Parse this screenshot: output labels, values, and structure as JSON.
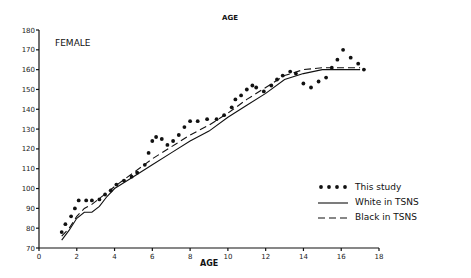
{
  "chart_data": {
    "type": "line",
    "title": "AGE",
    "panel_label": "FEMALE",
    "xlabel": "AGE",
    "ylabel": "",
    "xlim": [
      0,
      18
    ],
    "ylim": [
      70,
      180
    ],
    "x_ticks": [
      0,
      2,
      4,
      6,
      8,
      10,
      12,
      14,
      16,
      18
    ],
    "x_tick_labels": [
      "0",
      "2",
      "4",
      "6",
      "8",
      "10",
      "12",
      "14",
      "16",
      "18"
    ],
    "y_ticks": [
      70,
      80,
      90,
      100,
      110,
      120,
      130,
      140,
      150,
      160,
      170,
      180
    ],
    "y_tick_labels": [
      "70",
      "80",
      "90",
      "100",
      "110",
      "120",
      "130",
      "140",
      "150",
      "160",
      "170",
      "180"
    ],
    "grid": false,
    "legend_position": "lower right",
    "legend": [
      {
        "label": "This study",
        "style": "dots"
      },
      {
        "label": "White in TSNS",
        "style": "solid"
      },
      {
        "label": "Black in TSNS",
        "style": "dashed"
      }
    ],
    "series": [
      {
        "name": "This study",
        "style": "dots",
        "x": [
          1.2,
          1.4,
          1.7,
          1.9,
          2.1,
          2.5,
          2.8,
          3.2,
          3.5,
          3.8,
          4.1,
          4.5,
          4.9,
          5.2,
          5.6,
          5.8,
          6.0,
          6.2,
          6.5,
          6.8,
          7.1,
          7.4,
          7.7,
          8.0,
          8.4,
          8.9,
          9.4,
          9.8,
          10.2,
          10.4,
          10.7,
          11.0,
          11.3,
          11.5,
          11.9,
          12.3,
          12.6,
          12.9,
          13.3,
          13.6,
          14.0,
          14.4,
          14.8,
          15.2,
          15.5,
          15.8,
          16.1,
          16.5,
          16.9,
          17.2
        ],
        "y": [
          78,
          82,
          86,
          90,
          94,
          94,
          94,
          94.5,
          97,
          99,
          102,
          104,
          106,
          108,
          112,
          118,
          124,
          126,
          125,
          122,
          124,
          127,
          131,
          134,
          134,
          135,
          135,
          137,
          141,
          145,
          147,
          150,
          152,
          151,
          149,
          152,
          155,
          157,
          159,
          158,
          153,
          151,
          154,
          156,
          161,
          165,
          170,
          166,
          163,
          160
        ]
      },
      {
        "name": "White in TSNS",
        "style": "solid",
        "x": [
          1.2,
          1.6,
          2.0,
          2.4,
          2.8,
          3.2,
          3.6,
          4.0,
          5.0,
          6.0,
          7.0,
          8.0,
          9.0,
          10.0,
          11.0,
          12.0,
          13.0,
          14.0,
          15.0,
          16.0,
          17.0
        ],
        "y": [
          74,
          79,
          85,
          88,
          88,
          91,
          96,
          100,
          106,
          112,
          118,
          124,
          129,
          136,
          142,
          148,
          155,
          158,
          160,
          160,
          160
        ]
      },
      {
        "name": "Black in TSNS",
        "style": "dashed",
        "x": [
          1.2,
          1.6,
          2.0,
          2.4,
          2.8,
          3.2,
          3.6,
          4.0,
          5.0,
          6.0,
          7.0,
          8.0,
          9.0,
          10.0,
          11.0,
          12.0,
          13.0,
          14.0,
          15.0,
          16.0,
          17.0
        ],
        "y": [
          76,
          80,
          86,
          90,
          92,
          95,
          98,
          101,
          108,
          115,
          121,
          127,
          132,
          138,
          145,
          151,
          157,
          160,
          161,
          161,
          161
        ]
      }
    ]
  }
}
